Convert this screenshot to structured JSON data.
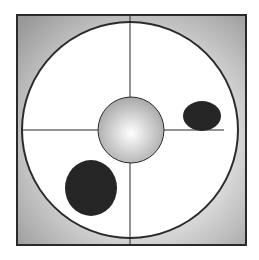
{
  "diagram": {
    "colors": {
      "frame_bg": "#9c9c9c",
      "stroke": "#2a2a2a",
      "circle_fill": "#ffffff",
      "blob": "#262626"
    },
    "elements": [
      "outer-frame",
      "main-circle",
      "crosshair",
      "center-sphere",
      "small-ellipse",
      "large-ellipse"
    ]
  }
}
